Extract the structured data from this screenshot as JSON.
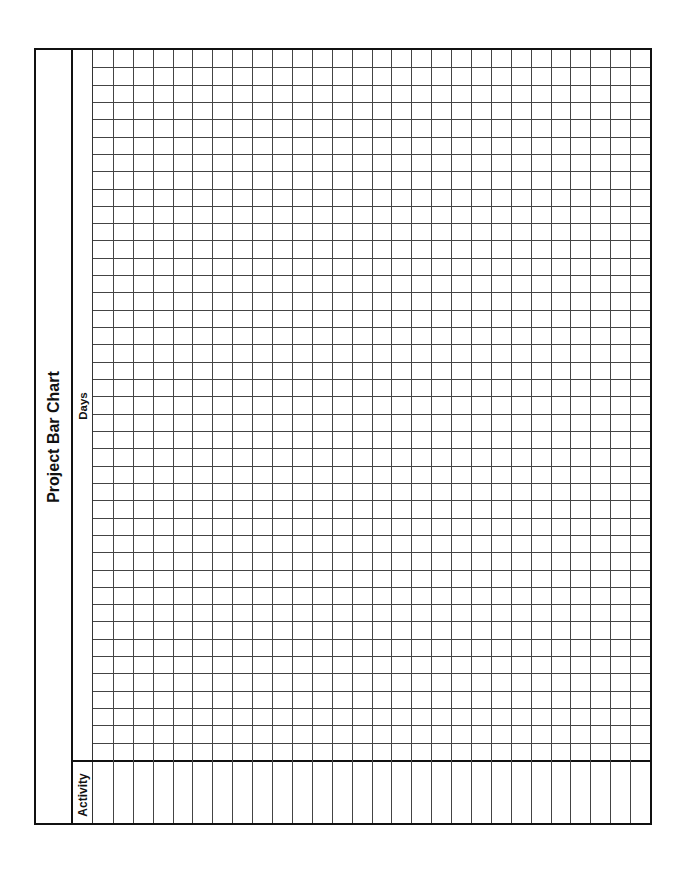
{
  "document": {
    "title": "Project Bar Chart",
    "days_label": "Days",
    "activity_label": "Activity",
    "orientation": "rotated-90-ccw",
    "grid": {
      "activity_columns": 28,
      "day_rows": 41,
      "line_color": "#444444",
      "border_color": "#111111"
    }
  }
}
